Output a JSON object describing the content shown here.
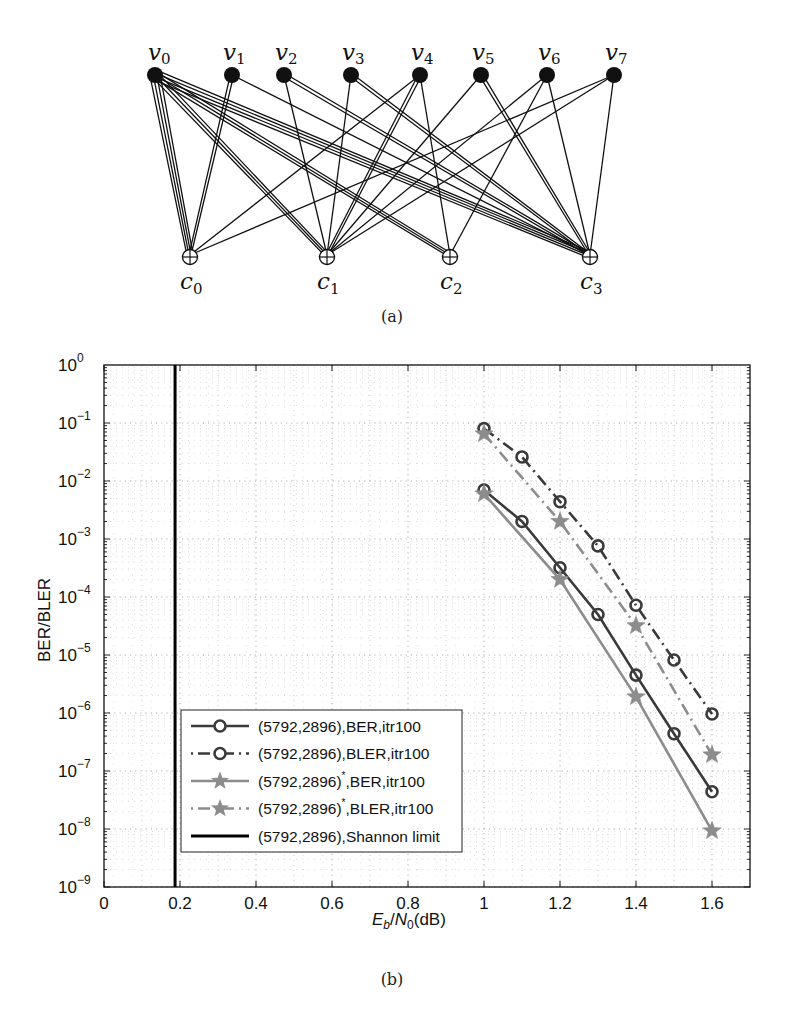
{
  "figure": {
    "panel_a_caption": "(a)",
    "panel_b_caption": "(b)"
  },
  "tanner_graph": {
    "variable_nodes": [
      {
        "name": "v",
        "sub": "0",
        "x": 155,
        "y": 75
      },
      {
        "name": "v",
        "sub": "1",
        "x": 232,
        "y": 75
      },
      {
        "name": "v",
        "sub": "2",
        "x": 284,
        "y": 75
      },
      {
        "name": "v",
        "sub": "3",
        "x": 351,
        "y": 75
      },
      {
        "name": "v",
        "sub": "4",
        "x": 420,
        "y": 75
      },
      {
        "name": "v",
        "sub": "5",
        "x": 481,
        "y": 75
      },
      {
        "name": "v",
        "sub": "6",
        "x": 547,
        "y": 75
      },
      {
        "name": "v",
        "sub": "7",
        "x": 614,
        "y": 75
      }
    ],
    "check_nodes": [
      {
        "name": "c",
        "sub": "0",
        "x": 190,
        "y": 257
      },
      {
        "name": "c",
        "sub": "1",
        "x": 327,
        "y": 257
      },
      {
        "name": "c",
        "sub": "2",
        "x": 450,
        "y": 257
      },
      {
        "name": "c",
        "sub": "3",
        "x": 590,
        "y": 257
      }
    ],
    "edges": [
      {
        "v": 0,
        "c": 0,
        "multiplicity": 4
      },
      {
        "v": 0,
        "c": 1,
        "multiplicity": 3
      },
      {
        "v": 0,
        "c": 2,
        "multiplicity": 3
      },
      {
        "v": 0,
        "c": 3,
        "multiplicity": 4
      },
      {
        "v": 1,
        "c": 0,
        "multiplicity": 2
      },
      {
        "v": 1,
        "c": 3,
        "multiplicity": 1
      },
      {
        "v": 2,
        "c": 1,
        "multiplicity": 1
      },
      {
        "v": 2,
        "c": 3,
        "multiplicity": 2
      },
      {
        "v": 3,
        "c": 1,
        "multiplicity": 1
      },
      {
        "v": 3,
        "c": 3,
        "multiplicity": 2
      },
      {
        "v": 4,
        "c": 0,
        "multiplicity": 1
      },
      {
        "v": 4,
        "c": 1,
        "multiplicity": 2
      },
      {
        "v": 4,
        "c": 2,
        "multiplicity": 1
      },
      {
        "v": 5,
        "c": 1,
        "multiplicity": 1
      },
      {
        "v": 5,
        "c": 3,
        "multiplicity": 2
      },
      {
        "v": 6,
        "c": 1,
        "multiplicity": 1
      },
      {
        "v": 6,
        "c": 2,
        "multiplicity": 1
      },
      {
        "v": 6,
        "c": 3,
        "multiplicity": 1
      },
      {
        "v": 7,
        "c": 0,
        "multiplicity": 1
      },
      {
        "v": 7,
        "c": 1,
        "multiplicity": 1
      },
      {
        "v": 7,
        "c": 3,
        "multiplicity": 1
      }
    ]
  },
  "chart_data": {
    "type": "line",
    "title": "",
    "xlabel": "E_b/N_0(dB)",
    "xlabel_parts": {
      "E": "E",
      "b": "b",
      "slash": "/",
      "N": "N",
      "zero": "0",
      "unit": "(dB)"
    },
    "ylabel": "BER/BLER",
    "yscale": "log",
    "xlim": [
      0,
      1.7
    ],
    "ylim": [
      1e-09,
      1
    ],
    "grid": true,
    "x_ticks": [
      "0",
      "0.2",
      "0.4",
      "0.6",
      "0.8",
      "1",
      "1.2",
      "1.4",
      "1.6"
    ],
    "x_tick_values": [
      0,
      0.2,
      0.4,
      0.6,
      0.8,
      1.0,
      1.2,
      1.4,
      1.6
    ],
    "y_ticks": [
      "10^0",
      "10^-1",
      "10^-2",
      "10^-3",
      "10^-4",
      "10^-5",
      "10^-6",
      "10^-7",
      "10^-8",
      "10^-9"
    ],
    "y_tick_exponents": [
      "0",
      "−1",
      "−2",
      "−3",
      "−4",
      "−5",
      "−6",
      "−7",
      "−8",
      "−9"
    ],
    "legend_position": "lower left",
    "series": [
      {
        "name": "(5792,2896),BER,itr100",
        "label_main": "(5792,2896)",
        "label_star": "",
        "label_rest": ",BER,itr100",
        "color": "#3a3a3a",
        "linestyle": "solid",
        "marker": "circle",
        "x": [
          1.0,
          1.1,
          1.2,
          1.3,
          1.4,
          1.5,
          1.6
        ],
        "values": [
          0.007,
          0.002,
          0.00032,
          5e-05,
          4.5e-06,
          4.4e-07,
          4.4e-08
        ]
      },
      {
        "name": "(5792,2896),BLER,itr100",
        "label_main": "(5792,2896)",
        "label_star": "",
        "label_rest": ",BLER,itr100",
        "color": "#3a3a3a",
        "linestyle": "dashdot",
        "marker": "circle",
        "x": [
          1.0,
          1.1,
          1.2,
          1.3,
          1.4,
          1.5,
          1.6
        ],
        "values": [
          0.08,
          0.026,
          0.0044,
          0.00076,
          7.2e-05,
          8.2e-06,
          9.6e-07
        ]
      },
      {
        "name": "(5792,2896)*,BER,itr100",
        "label_main": "(5792,2896)",
        "label_star": "*",
        "label_rest": ",BER,itr100",
        "color": "#8c8c8c",
        "linestyle": "solid",
        "marker": "star",
        "x": [
          1.0,
          1.2,
          1.4,
          1.6
        ],
        "values": [
          0.006,
          0.0002,
          1.9e-06,
          9.3e-09
        ]
      },
      {
        "name": "(5792,2896)*,BLER,itr100",
        "label_main": "(5792,2896)",
        "label_star": "*",
        "label_rest": ",BLER,itr100",
        "color": "#8c8c8c",
        "linestyle": "dashdot",
        "marker": "star",
        "x": [
          1.0,
          1.2,
          1.4,
          1.6
        ],
        "values": [
          0.065,
          0.002,
          3.2e-05,
          1.9e-07
        ]
      },
      {
        "name": "(5792,2896),Shannon limit",
        "label_main": "(5792,2896)",
        "label_star": "",
        "label_rest": ",Shannon limit",
        "color": "#000000",
        "linestyle": "solid",
        "marker": "none",
        "vertical_x": 0.187
      }
    ]
  }
}
